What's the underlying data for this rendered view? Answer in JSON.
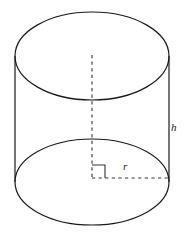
{
  "figure": {
    "name": "cylinder-diagram",
    "type": "geometric-solid",
    "solid": "right circular cylinder",
    "background_color": "#ffffff",
    "stroke_color": "#1a1a1a",
    "dash_color": "#333333",
    "stroke_width": 1.2,
    "canvas": {
      "width": 185,
      "height": 237
    },
    "geometry": {
      "top_ellipse": {
        "cx": 92,
        "cy": 56,
        "rx": 77,
        "ry": 44
      },
      "bottom_ellipse": {
        "cx": 92,
        "cy": 182,
        "rx": 77,
        "ry": 43
      },
      "left_side": {
        "x": 15,
        "y1": 56,
        "y2": 182
      },
      "right_side": {
        "x": 169,
        "y1": 56,
        "y2": 182
      },
      "axis_dashed": {
        "x": 92,
        "y1": 55,
        "y2": 178
      },
      "radius_dashed": {
        "y": 178,
        "x1": 92,
        "x2": 169
      },
      "right_angle_marker": {
        "x": 92,
        "y": 178,
        "size": 13
      }
    },
    "labels": {
      "height": "h",
      "radius": "r"
    }
  }
}
